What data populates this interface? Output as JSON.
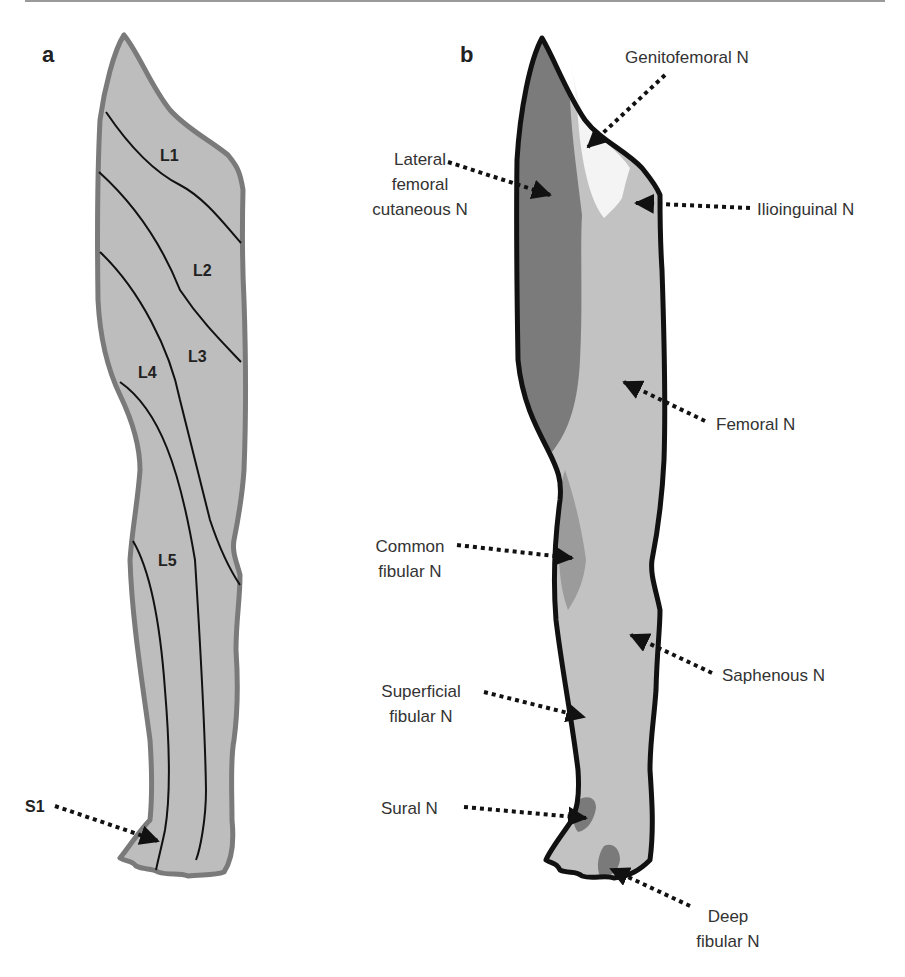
{
  "figure": {
    "panels": [
      {
        "letter": "a",
        "description": "Dermatomes of the lower limb",
        "dermatomes": [
          "L1",
          "L2",
          "L3",
          "L4",
          "L5",
          "S1"
        ]
      },
      {
        "letter": "b",
        "description": "Cutaneous nerve territories of the lower limb",
        "nerves": [
          {
            "lines": [
              "Genitofemoral N"
            ]
          },
          {
            "lines": [
              "Lateral",
              "femoral",
              "cutaneous N"
            ]
          },
          {
            "lines": [
              "Ilioinguinal N"
            ]
          },
          {
            "lines": [
              "Femoral N"
            ]
          },
          {
            "lines": [
              "Common",
              "fibular N"
            ]
          },
          {
            "lines": [
              "Saphenous N"
            ]
          },
          {
            "lines": [
              "Superficial",
              "fibular N"
            ]
          },
          {
            "lines": [
              "Sural N"
            ]
          },
          {
            "lines": [
              "Deep",
              "fibular N"
            ]
          }
        ]
      }
    ],
    "colors": {
      "leg_fill": "#bcbcbc",
      "leg_outline_a": "#7a7a7a",
      "leg_outline_b": "#111111",
      "lateral_femoral": "#7c7c7c",
      "genitofemoral": "#f4f4f4",
      "femoral": "#c6c6c6",
      "common_fibular": "#9a9a9a",
      "sural_deep": "#7a7a7a"
    }
  }
}
